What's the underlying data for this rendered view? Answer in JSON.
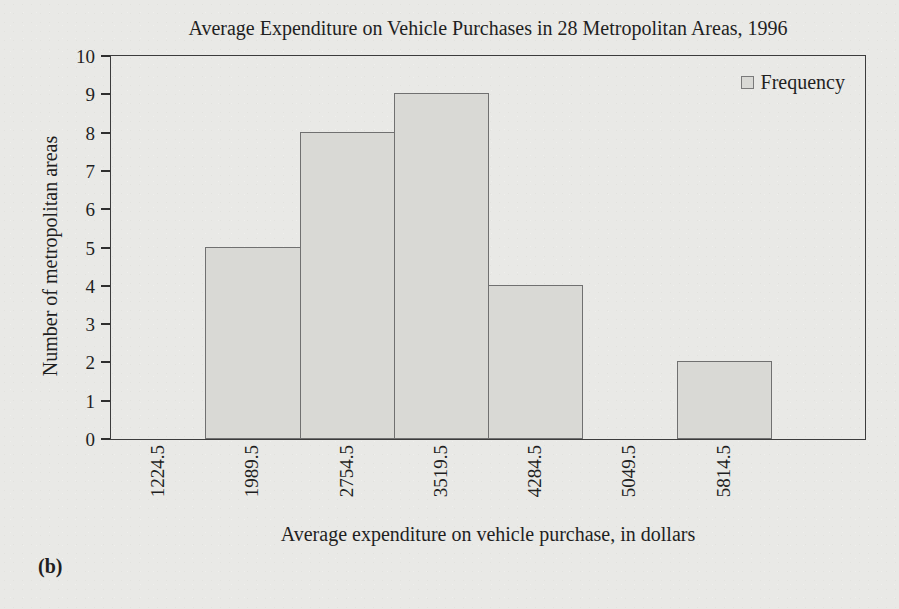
{
  "figure_label": "(b)",
  "chart_data": {
    "type": "bar",
    "title": "Average Expenditure on Vehicle Purchases in 28 Metropolitan Areas, 1996",
    "xlabel": "Average expenditure on vehicle purchase, in dollars",
    "ylabel": "Number of metropolitan areas",
    "categories": [
      "1224.5",
      "1989.5",
      "2754.5",
      "3519.5",
      "4284.5",
      "5049.5",
      "5814.5"
    ],
    "values": [
      0,
      5,
      8,
      9,
      4,
      0,
      2
    ],
    "ylim": [
      0,
      10
    ],
    "ytick_step": 1,
    "grid": false,
    "bar_alignment": "bars one class wide, centered on tick labels (class midpoints)",
    "legend": {
      "position": "top-right",
      "entries": [
        {
          "label": "Frequency",
          "swatch_color": "#d9d9d5"
        }
      ]
    },
    "colors": {
      "bar_fill": "#d9d9d5",
      "bar_border": "#707070",
      "axis": "#3c3c3c",
      "background": "#e9e9e6",
      "text": "#1f1f1f"
    }
  }
}
